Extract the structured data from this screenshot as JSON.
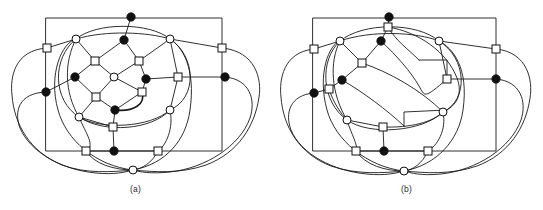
{
  "figure": {
    "background_color": "#ffffff",
    "line_color": "#1a1a1a",
    "filled_node_color": "#111111",
    "open_node_color": "#ffffff",
    "panels": [
      {
        "id": "a",
        "caption": "(a)",
        "frame": {
          "x": 46,
          "y": 18,
          "w": 176,
          "h": 133
        },
        "legend_note": "filled circles, open circles and open squares denote three vertex classes",
        "nodes": [
          {
            "id": "a1",
            "shape": "filled-circle",
            "x": 131,
            "y": 17
          },
          {
            "id": "a2",
            "shape": "filled-circle",
            "x": 124,
            "y": 40
          },
          {
            "id": "a3",
            "shape": "open-circle",
            "x": 76,
            "y": 39
          },
          {
            "id": "a4",
            "shape": "open-circle",
            "x": 170,
            "y": 39
          },
          {
            "id": "a5",
            "shape": "open-square",
            "x": 47,
            "y": 48
          },
          {
            "id": "a6",
            "shape": "open-square",
            "x": 222,
            "y": 48
          },
          {
            "id": "a7",
            "shape": "open-square",
            "x": 95,
            "y": 61
          },
          {
            "id": "a8",
            "shape": "open-square",
            "x": 139,
            "y": 61
          },
          {
            "id": "a9",
            "shape": "open-circle",
            "x": 114,
            "y": 77
          },
          {
            "id": "a10",
            "shape": "filled-circle",
            "x": 75,
            "y": 77
          },
          {
            "id": "a11",
            "shape": "filled-circle",
            "x": 146,
            "y": 79
          },
          {
            "id": "a12",
            "shape": "open-square",
            "x": 178,
            "y": 77
          },
          {
            "id": "a13",
            "shape": "filled-circle",
            "x": 225,
            "y": 77
          },
          {
            "id": "a14",
            "shape": "filled-circle",
            "x": 46,
            "y": 92
          },
          {
            "id": "a15",
            "shape": "open-square",
            "x": 142,
            "y": 92
          },
          {
            "id": "a16",
            "shape": "open-square",
            "x": 96,
            "y": 97
          },
          {
            "id": "a17",
            "shape": "filled-circle",
            "x": 115,
            "y": 110
          },
          {
            "id": "a18",
            "shape": "open-circle",
            "x": 79,
            "y": 117
          },
          {
            "id": "a19",
            "shape": "open-circle",
            "x": 170,
            "y": 110
          },
          {
            "id": "a20",
            "shape": "open-square",
            "x": 113,
            "y": 127
          },
          {
            "id": "a21",
            "shape": "filled-circle",
            "x": 114,
            "y": 151
          },
          {
            "id": "a22",
            "shape": "open-square",
            "x": 86,
            "y": 151
          },
          {
            "id": "a23",
            "shape": "open-square",
            "x": 158,
            "y": 151
          },
          {
            "id": "a24",
            "shape": "open-circle",
            "x": 133,
            "y": 170
          }
        ]
      },
      {
        "id": "b",
        "caption": "(b)",
        "frame": {
          "x": 42,
          "y": 18,
          "w": 183,
          "h": 133
        },
        "legend_note": "same vertex set redrawn with different edge routing",
        "nodes": [
          {
            "id": "b1",
            "shape": "filled-circle",
            "x": 118,
            "y": 17
          },
          {
            "id": "b2",
            "shape": "open-square",
            "x": 117,
            "y": 27
          },
          {
            "id": "b3",
            "shape": "filled-circle",
            "x": 110,
            "y": 41
          },
          {
            "id": "b4",
            "shape": "open-circle",
            "x": 69,
            "y": 41
          },
          {
            "id": "b5",
            "shape": "open-circle",
            "x": 168,
            "y": 41
          },
          {
            "id": "b6",
            "shape": "open-square",
            "x": 43,
            "y": 49
          },
          {
            "id": "b7",
            "shape": "open-square",
            "x": 225,
            "y": 49
          },
          {
            "id": "b8",
            "shape": "open-square",
            "x": 91,
            "y": 63
          },
          {
            "id": "b9",
            "shape": "filled-circle",
            "x": 71,
            "y": 80
          },
          {
            "id": "b10",
            "shape": "open-square",
            "x": 176,
            "y": 79
          },
          {
            "id": "b11",
            "shape": "filled-circle",
            "x": 225,
            "y": 79
          },
          {
            "id": "b12",
            "shape": "open-square",
            "x": 58,
            "y": 89
          },
          {
            "id": "b13",
            "shape": "filled-circle",
            "x": 43,
            "y": 93
          },
          {
            "id": "b14",
            "shape": "open-circle",
            "x": 76,
            "y": 120
          },
          {
            "id": "b15",
            "shape": "open-square",
            "x": 112,
            "y": 127
          },
          {
            "id": "b16",
            "shape": "open-circle",
            "x": 172,
            "y": 112
          },
          {
            "id": "b17",
            "shape": "open-square",
            "x": 85,
            "y": 151
          },
          {
            "id": "b18",
            "shape": "filled-circle",
            "x": 113,
            "y": 151
          },
          {
            "id": "b19",
            "shape": "open-square",
            "x": 157,
            "y": 151
          },
          {
            "id": "b20",
            "shape": "open-circle",
            "x": 133,
            "y": 171
          }
        ]
      }
    ]
  }
}
